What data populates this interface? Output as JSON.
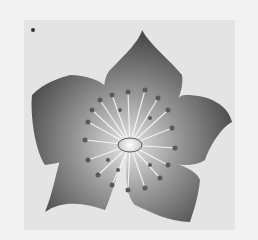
{
  "image": {
    "subject": "flower-illustration",
    "alt": "Grayscale illustration of a five-petaled flower with stamens",
    "colors": {
      "background": "#f2f2f2",
      "panel": "#e4e4e4",
      "petal_dark": "#4a4a4a",
      "petal_light": "#d8d8d8",
      "center": "#ffffff",
      "stamen": "#5a5a5a"
    }
  }
}
